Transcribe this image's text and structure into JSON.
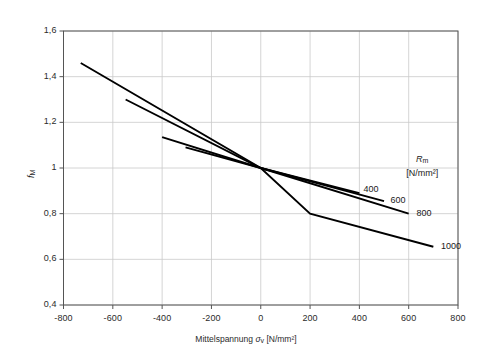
{
  "chart_data": {
    "type": "line",
    "title": "",
    "subtitle": "",
    "xlabel": "Mittelspannung σv [N/mm²]",
    "xlabel_text": "Mittelspannung",
    "xlabel_symbol": "σ",
    "xlabel_symbol_sub": "v",
    "xlabel_units": "[N/mm²]",
    "ylabel": "fM",
    "ylabel_symbol": "f",
    "ylabel_symbol_sub": "M",
    "xlim": [
      -800,
      800
    ],
    "ylim": [
      0.4,
      1.6
    ],
    "xticks": [
      -800,
      -600,
      -400,
      -200,
      0,
      200,
      400,
      600,
      800
    ],
    "xtick_labels": [
      "-800",
      "-600",
      "-400",
      "-200",
      "0",
      "200",
      "400",
      "600",
      "800"
    ],
    "yticks": [
      0.4,
      0.6,
      0.8,
      1.0,
      1.2,
      1.4,
      1.6
    ],
    "ytick_labels": [
      "0,4",
      "0,6",
      "0,8",
      "1",
      "1,2",
      "1,4",
      "1,6"
    ],
    "grid": true,
    "grid_color": "#c9c9c9",
    "axis_color": "#555555",
    "line_color": "#000000",
    "legend_position": "right-inside",
    "legend_title": "Rm",
    "legend_title_symbol": "R",
    "legend_title_sub": "m",
    "legend_units": "[N/mm²]",
    "series": [
      {
        "name": "400",
        "label": "400",
        "label_x": 400,
        "label_y": 0.905,
        "points": [
          [
            -305,
            1.09
          ],
          [
            0,
            1.0
          ],
          [
            400,
            0.89
          ]
        ]
      },
      {
        "name": "600",
        "label": "600",
        "label_x": 510,
        "label_y": 0.855,
        "points": [
          [
            -400,
            1.135
          ],
          [
            0,
            1.0
          ],
          [
            500,
            0.855
          ]
        ]
      },
      {
        "name": "800",
        "label": "800",
        "label_x": 615,
        "label_y": 0.8,
        "points": [
          [
            -548,
            1.3
          ],
          [
            0,
            1.0
          ],
          [
            600,
            0.8
          ]
        ]
      },
      {
        "name": "1000",
        "label": "1000",
        "label_x": 715,
        "label_y": 0.655,
        "points": [
          [
            -730,
            1.46
          ],
          [
            0,
            1.0
          ],
          [
            200,
            0.8
          ],
          [
            700,
            0.655
          ]
        ]
      }
    ]
  }
}
